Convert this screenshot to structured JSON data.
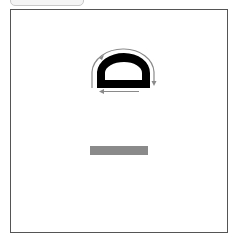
{
  "diagram": {
    "colors": {
      "frame_border": "#555555",
      "shape_fill": "#000000",
      "arrow_color": "#8a8a8a",
      "bar_color": "#8a8a8a",
      "tab_fill": "#f4f4f4"
    },
    "elements": {
      "shape": "d-profile",
      "arrows": [
        "arc-arrow-clockwise",
        "horizontal-arrow-left"
      ],
      "bar": "gray-bar"
    }
  }
}
